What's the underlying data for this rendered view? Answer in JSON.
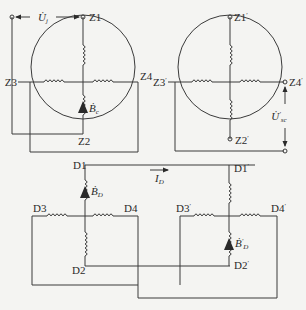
{
  "figure": {
    "type": "electrical winding connection diagram",
    "background": "#f4f4f2",
    "line_color": "#3a3a3a"
  },
  "left_machine": {
    "terminals": {
      "z1": "Z1",
      "z2": "Z2",
      "z3": "Z3",
      "z4": "Z4"
    },
    "voltage_label": "U̇",
    "voltage_sub": "j",
    "flux_label": "Ḃ",
    "flux_sub": "c"
  },
  "right_machine": {
    "terminals": {
      "z1": "Z1",
      "z1_prime": "′",
      "z2": "Z2",
      "z2_prime": "′",
      "z3": "Z3",
      "z3_prime": "′",
      "z4": "Z4",
      "z4_prime": "′"
    },
    "voltage_label": "U̇",
    "voltage_sub": "sc",
    "voltage_prime": "′"
  },
  "bottom_circuit": {
    "left_terminals": {
      "d1": "D1",
      "d2": "D2",
      "d3": "D3",
      "d4": "D4"
    },
    "right_terminals": {
      "d1": "D1",
      "d2": "D2",
      "d3": "D3",
      "d4": "D4",
      "prime": "′"
    },
    "current_label": "I",
    "current_sub": "D",
    "flux_left_label": "Ḃ",
    "flux_left_sub": "D",
    "flux_right_label": "Ḃ",
    "flux_right_sub": "D",
    "flux_right_prime": "′"
  }
}
